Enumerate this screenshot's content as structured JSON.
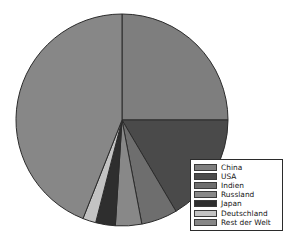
{
  "chart_data": {
    "type": "pie",
    "title": "",
    "legend_position": "bottom-right",
    "start_angle_deg": 0,
    "direction": "clockwise",
    "categories": [
      "China",
      "USA",
      "Indien",
      "Russland",
      "Japan",
      "Deutschland",
      "Rest der Welt"
    ],
    "values": [
      25.0,
      16.5,
      5.5,
      4.0,
      3.0,
      2.0,
      44.0
    ],
    "units": "percent",
    "colors": [
      "#7e7e7e",
      "#4a4a4a",
      "#6e6e6e",
      "#888888",
      "#2e2e2e",
      "#c3c3c3",
      "#878787"
    ],
    "slices": [
      {
        "label": "China",
        "value": 25.0,
        "color": "#7e7e7e"
      },
      {
        "label": "USA",
        "value": 16.5,
        "color": "#4a4a4a"
      },
      {
        "label": "Indien",
        "value": 5.5,
        "color": "#6e6e6e"
      },
      {
        "label": "Russland",
        "value": 4.0,
        "color": "#888888"
      },
      {
        "label": "Japan",
        "value": 3.0,
        "color": "#2e2e2e"
      },
      {
        "label": "Deutschland",
        "value": 2.0,
        "color": "#c3c3c3"
      },
      {
        "label": "Rest der Welt",
        "value": 44.0,
        "color": "#878787"
      }
    ]
  },
  "legend": {
    "items": [
      {
        "label": "China",
        "color": "#7e7e7e"
      },
      {
        "label": "USA",
        "color": "#4a4a4a"
      },
      {
        "label": "Indien",
        "color": "#6e6e6e"
      },
      {
        "label": "Russland",
        "color": "#888888"
      },
      {
        "label": "Japan",
        "color": "#2e2e2e"
      },
      {
        "label": "Deutschland",
        "color": "#c3c3c3"
      },
      {
        "label": "Rest der Welt",
        "color": "#878787"
      }
    ]
  },
  "pie_geometry": {
    "center_x": 122,
    "center_y": 120,
    "radius": 106,
    "outline_color": "#2b2b2b"
  }
}
